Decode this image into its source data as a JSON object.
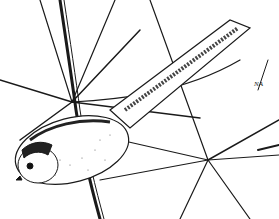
{
  "illustration": {
    "subject": "long-tailed tit perched among bare branches",
    "style": "black ink line drawing",
    "signature": "NA",
    "colors": {
      "ink": "#1a1a1a",
      "paper": "#ffffff"
    }
  }
}
